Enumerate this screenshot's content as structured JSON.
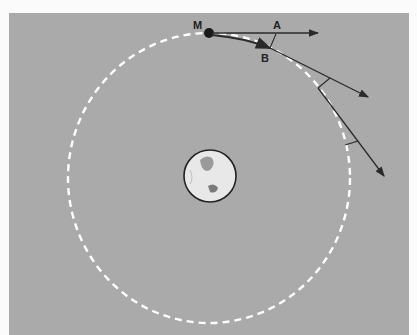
{
  "figure": {
    "labels": {
      "moon": "M",
      "straight_path_point": "A",
      "orbit_point": "B"
    },
    "colors": {
      "background": "#aaaaaa",
      "orbit": "#ffffff",
      "vectors": "#2a2a2a",
      "earth_fill": "#e6e6e6"
    },
    "elements": [
      "Earth",
      "dashed circular orbit",
      "Moon M",
      "tangent arrow to A",
      "curved path to B",
      "two further tangent arrows with fall markers"
    ]
  }
}
